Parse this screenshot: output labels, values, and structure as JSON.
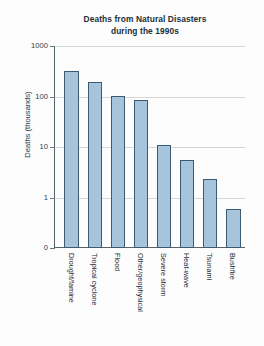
{
  "chart_data": {
    "type": "bar",
    "title": "Deaths from Natural Disasters during the 1990s",
    "title_line1": "Deaths from Natural Disasters",
    "title_line2": "during the 1990s",
    "xlabel": "",
    "ylabel": "Deaths (thousands)",
    "yscale": "log",
    "ylim": [
      0.4,
      1000
    ],
    "ytick_labels": [
      "1000",
      "100",
      "10",
      "1",
      "0"
    ],
    "ytick_values": [
      1000,
      100,
      10,
      1,
      0
    ],
    "grid": true,
    "legend": null,
    "bar_color": "#a6c5dd",
    "bar_edge_color": "#3c5a72",
    "categories": [
      "Drought/famine",
      "Tropical cyclone",
      "Flood",
      "Other/geophysical",
      "Severe storm",
      "Heat-wave",
      "Tsunami",
      "Bushfire"
    ],
    "values": [
      320,
      190,
      102,
      85,
      11,
      5.5,
      2.3,
      0.6
    ]
  },
  "axes": {
    "y_title": "Deaths (thousands)"
  }
}
